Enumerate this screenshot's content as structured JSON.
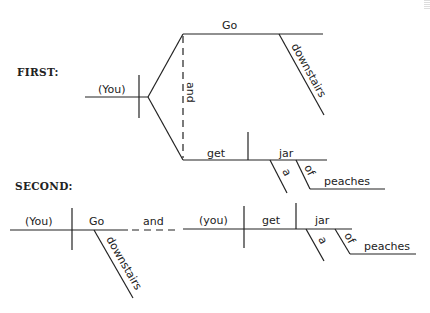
{
  "labels": {
    "first": "FIRST:",
    "second": "SECOND:"
  },
  "first_diagram": {
    "subject": "(You)",
    "conjunction": "and",
    "predicate_1": {
      "verb": "Go",
      "modifier": "downstairs"
    },
    "predicate_2": {
      "verb": "get",
      "object": "jar",
      "article": "a",
      "preposition": "of",
      "prep_object": "peaches"
    }
  },
  "second_diagram": {
    "clause_1": {
      "subject": "(You)",
      "verb": "Go",
      "modifier": "downstairs"
    },
    "conjunction": "and",
    "clause_2": {
      "subject": "(you)",
      "verb": "get",
      "object": "jar",
      "article": "a",
      "preposition": "of",
      "prep_object": "peaches"
    }
  }
}
